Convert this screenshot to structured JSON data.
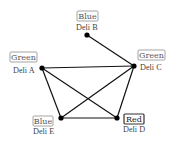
{
  "diagram": {
    "type": "graph-coloring",
    "nodes": [
      {
        "id": "A",
        "name": "Deli A",
        "color_label": "Green"
      },
      {
        "id": "B",
        "name": "Deli B",
        "color_label": "Blue"
      },
      {
        "id": "C",
        "name": "Deli C",
        "color_label": "Green"
      },
      {
        "id": "D",
        "name": "Deli D",
        "color_label": "Red"
      },
      {
        "id": "E",
        "name": "Deli E",
        "color_label": "Blue"
      }
    ],
    "edges": [
      [
        "B",
        "C"
      ],
      [
        "A",
        "C"
      ],
      [
        "A",
        "E"
      ],
      [
        "A",
        "D"
      ],
      [
        "C",
        "E"
      ],
      [
        "C",
        "D"
      ],
      [
        "E",
        "D"
      ]
    ]
  }
}
